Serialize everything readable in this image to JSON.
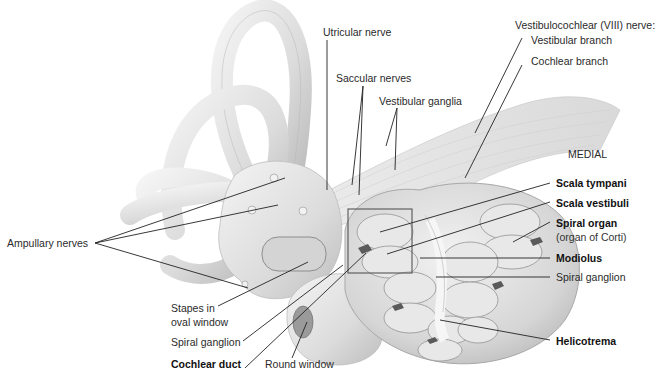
{
  "diagram": {
    "orientation_label": "MEDIAL",
    "colors": {
      "background": "#ffffff",
      "structure_fill": "#e4e4e4",
      "structure_shade": "#c8c8c8",
      "structure_highlight": "#f4f4f4",
      "outline": "#9a9a9a",
      "leader_line": "#222222",
      "label_text": "#2a2a2a"
    },
    "labels": [
      {
        "id": "utricular-nerve",
        "text": "Utricular nerve",
        "bold": false
      },
      {
        "id": "vestibulocochlear-nerve",
        "text": "Vestibulocochlear (VIII) nerve:",
        "bold": false
      },
      {
        "id": "vestibular-branch",
        "text": "Vestibular branch",
        "bold": false
      },
      {
        "id": "cochlear-branch",
        "text": "Cochlear branch",
        "bold": false
      },
      {
        "id": "saccular-nerves",
        "text": "Saccular nerves",
        "bold": false
      },
      {
        "id": "vestibular-ganglia",
        "text": "Vestibular ganglia",
        "bold": false
      },
      {
        "id": "medial",
        "text": "MEDIAL",
        "bold": false
      },
      {
        "id": "scala-tympani",
        "text": "Scala tympani",
        "bold": true
      },
      {
        "id": "scala-vestibuli",
        "text": "Scala vestibuli",
        "bold": true
      },
      {
        "id": "spiral-organ",
        "text": "Spiral organ",
        "bold": true
      },
      {
        "id": "organ-of-corti",
        "text": "(organ of Corti)",
        "bold": false
      },
      {
        "id": "modiolus",
        "text": "Modiolus",
        "bold": true
      },
      {
        "id": "spiral-ganglion-right",
        "text": "Spiral ganglion",
        "bold": false
      },
      {
        "id": "helicotrema",
        "text": "Helicotrema",
        "bold": true
      },
      {
        "id": "ampullary-nerves",
        "text": "Ampullary nerves",
        "bold": false
      },
      {
        "id": "stapes-line1",
        "text": "Stapes in",
        "bold": false
      },
      {
        "id": "stapes-line2",
        "text": "oval window",
        "bold": false
      },
      {
        "id": "spiral-ganglion-left",
        "text": "Spiral ganglion",
        "bold": false
      },
      {
        "id": "cochlear-duct",
        "text": "Cochlear duct",
        "bold": true
      },
      {
        "id": "round-window",
        "text": "Round window",
        "bold": false
      }
    ]
  }
}
